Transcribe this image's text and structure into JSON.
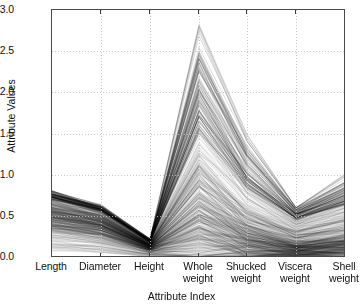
{
  "chart_data": {
    "type": "line",
    "subtype": "parallel-coordinates",
    "title": "",
    "xlabel": "Attribute Index",
    "ylabel": "Attribute Values",
    "categories": [
      "Length",
      "Diameter",
      "Height",
      "Whole\nweight",
      "Shucked\nweight",
      "Viscera\nweight",
      "Shell\nweight"
    ],
    "axis_labels_flat": [
      "Length",
      "Diameter",
      "Height",
      "Whole weight",
      "Shucked weight",
      "Viscera weight",
      "Shell weight"
    ],
    "ylim": [
      0.0,
      3.0
    ],
    "yticks": [
      0.0,
      0.5,
      1.0,
      1.5,
      2.0,
      2.5,
      3.0
    ],
    "ytick_labels": [
      "0.0",
      "0.5",
      "1.0",
      "1.5",
      "2.0",
      "2.5",
      "3.0"
    ],
    "grid": true,
    "grid_style": "dotted",
    "grid_color": "#bfbfbf",
    "legend": "none",
    "line_color": "#000000",
    "line_alpha": 0.08,
    "line_width": 0.5,
    "n_series": 520,
    "axis_ranges": [
      {
        "name": "Length",
        "min": 0.075,
        "max": 0.815,
        "typical": 0.52
      },
      {
        "name": "Diameter",
        "min": 0.055,
        "max": 0.65,
        "typical": 0.41
      },
      {
        "name": "Height",
        "min": 0.0,
        "max": 0.25,
        "typical": 0.14
      },
      {
        "name": "Whole weight",
        "min": 0.002,
        "max": 2.826,
        "typical": 0.83
      },
      {
        "name": "Shucked weight",
        "min": 0.001,
        "max": 1.488,
        "typical": 0.36
      },
      {
        "name": "Viscera weight",
        "min": 0.0,
        "max": 0.6,
        "typical": 0.18
      },
      {
        "name": "Shell weight",
        "min": 0.001,
        "max": 1.005,
        "typical": 0.24
      }
    ],
    "series": [
      {
        "name": "outlier-max",
        "values": [
          0.8,
          0.63,
          0.22,
          2.826,
          1.49,
          0.6,
          1.005
        ]
      },
      {
        "name": "p99",
        "values": [
          0.78,
          0.61,
          0.21,
          2.5,
          1.32,
          0.58,
          0.88
        ]
      },
      {
        "name": "p95",
        "values": [
          0.75,
          0.59,
          0.2,
          2.0,
          1.05,
          0.52,
          0.76
        ]
      },
      {
        "name": "p90",
        "values": [
          0.72,
          0.56,
          0.19,
          1.68,
          0.88,
          0.46,
          0.66
        ]
      },
      {
        "name": "p75",
        "values": [
          0.65,
          0.51,
          0.17,
          1.18,
          0.62,
          0.34,
          0.48
        ]
      },
      {
        "name": "median",
        "values": [
          0.55,
          0.43,
          0.14,
          0.8,
          0.34,
          0.17,
          0.23
        ]
      },
      {
        "name": "p25",
        "values": [
          0.45,
          0.35,
          0.12,
          0.44,
          0.19,
          0.09,
          0.13
        ]
      },
      {
        "name": "p10",
        "values": [
          0.33,
          0.25,
          0.08,
          0.18,
          0.07,
          0.04,
          0.06
        ]
      },
      {
        "name": "p05",
        "values": [
          0.26,
          0.19,
          0.06,
          0.1,
          0.04,
          0.02,
          0.03
        ]
      },
      {
        "name": "min",
        "values": [
          0.075,
          0.055,
          0.0,
          0.002,
          0.001,
          0.0,
          0.001
        ]
      }
    ]
  },
  "figure": {
    "width": 363,
    "height": 308,
    "background": "#ffffff",
    "frame_color": "#4a4a4a"
  }
}
